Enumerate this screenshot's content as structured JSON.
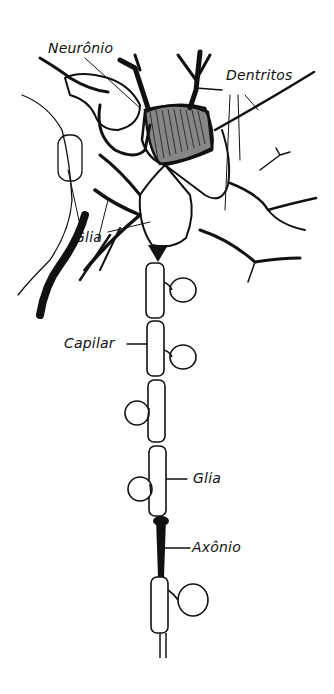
{
  "diagram": {
    "type": "labeled-illustration",
    "labels": {
      "neuron": "Neurônio",
      "dendrites": "Dentritos",
      "glia_top": "Glia",
      "capillary": "Capilar",
      "glia_bottom": "Glia",
      "axon": "Axônio"
    },
    "colors": {
      "ink": "#111111",
      "background": "#ffffff"
    }
  }
}
